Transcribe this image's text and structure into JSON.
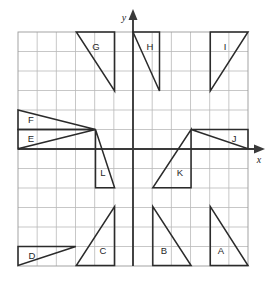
{
  "figure": {
    "grid": {
      "x_min_px": 18,
      "y_min_px": 32,
      "x_max_px": 248,
      "y_max_px": 266,
      "columns": 12,
      "rows": 12,
      "cell_width_px": 19.17,
      "cell_height_px": 19.5,
      "line_color": "#b9b9b9",
      "border_color": "#9a9a9a",
      "visible": true
    },
    "axes": {
      "origin_px": {
        "x": 133,
        "y": 149
      },
      "x_axis": {
        "label": "x",
        "label_px": {
          "x": 259,
          "y": 161
        },
        "color": "#3a3a3a",
        "arrow": "right"
      },
      "y_axis": {
        "label": "y",
        "label_px": {
          "x": 124,
          "y": 19
        },
        "color": "#3a3a3a",
        "arrow": "up"
      }
    },
    "shape_style": {
      "stroke": "#2b2b2b",
      "fill": "none"
    },
    "shapes": [
      {
        "label": "A",
        "type": "right-triangle",
        "points_px": "210.3,206.5 210.3,265.5 248.0,265.5",
        "label_px": {
          "x": 221,
          "y": 251
        }
      },
      {
        "label": "B",
        "type": "right-triangle",
        "points_px": "152.8,206.5 152.8,265.5 191.1,265.5",
        "label_px": {
          "x": 164,
          "y": 251
        }
      },
      {
        "label": "C",
        "type": "right-triangle",
        "points_px": "114.6,206.5 114.6,265.5 76.3,265.5",
        "label_px": {
          "x": 103,
          "y": 251
        }
      },
      {
        "label": "D",
        "type": "right-triangle",
        "points_px": "18.0,246.5 75.8,246.5 18.0,265.5",
        "label_px": {
          "x": 32,
          "y": 256
        }
      },
      {
        "label": "E",
        "type": "right-triangle",
        "points_px": "18.0,129.5 95.5,129.5 18.0,148.8",
        "label_px": {
          "x": 31,
          "y": 139
        }
      },
      {
        "label": "F",
        "type": "right-triangle",
        "points_px": "18.0,110.0 18.0,129.5 95.5,129.5",
        "label_px": {
          "x": 31,
          "y": 120
        }
      },
      {
        "label": "G",
        "type": "right-triangle",
        "points_px": "76.3,32.0 114.6,32.0 114.6,91.0",
        "label_px": {
          "x": 96,
          "y": 47
        }
      },
      {
        "label": "H",
        "type": "right-triangle",
        "points_px": "133.0,32.0 159.5,32.0 159.5,91.0",
        "label_px": {
          "x": 150,
          "y": 47
        }
      },
      {
        "label": "I",
        "type": "right-triangle",
        "points_px": "210.3,32.0 248.0,32.0 210.3,91.0",
        "label_px": {
          "x": 225,
          "y": 47
        }
      },
      {
        "label": "J",
        "type": "right-triangle",
        "points_px": "191.1,129.5 248.0,129.5 248.0,148.8",
        "label_px": {
          "x": 234,
          "y": 139
        }
      },
      {
        "label": "K",
        "type": "right-triangle",
        "points_px": "191.1,129.5 191.1,187.8 152.8,187.8",
        "label_px": {
          "x": 180,
          "y": 173
        }
      },
      {
        "label": "L",
        "type": "right-triangle",
        "points_px": "95.5,129.5 95.5,187.8 114.6,187.8",
        "label_px": {
          "x": 103,
          "y": 173
        }
      }
    ]
  }
}
